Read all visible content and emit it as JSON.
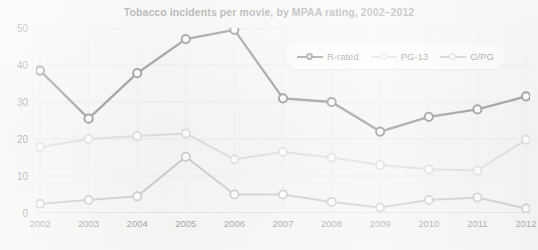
{
  "chart_data": {
    "type": "line",
    "title": "Tobacco incidents per movie, by MPAA rating, 2002–2012",
    "xlabel": "",
    "ylabel": "",
    "categories": [
      "2002",
      "2003",
      "2004",
      "2005",
      "2006",
      "2007",
      "2008",
      "2009",
      "2010",
      "2011",
      "2012"
    ],
    "ylim": [
      0,
      50
    ],
    "y_ticks": [
      0,
      10,
      20,
      30,
      40,
      50
    ],
    "grid": true,
    "legend_position": "top-right",
    "series": [
      {
        "name": "R-rated",
        "color": "#4a4a4a",
        "values": [
          38.5,
          25.5,
          37.8,
          47.0,
          49.5,
          31.0,
          30.0,
          22.0,
          26.0,
          28.0,
          31.5
        ]
      },
      {
        "name": "PG-13",
        "color": "#c9c9c7",
        "values": [
          17.8,
          20.0,
          20.8,
          21.5,
          14.5,
          16.5,
          15.0,
          13.0,
          11.8,
          11.5,
          19.8
        ]
      },
      {
        "name": "G/PG",
        "color": "#a9a9a7",
        "values": [
          2.5,
          3.5,
          4.5,
          15.2,
          5.0,
          5.0,
          3.0,
          1.5,
          3.5,
          4.2,
          1.2
        ]
      }
    ]
  },
  "legend": {
    "items": [
      {
        "label": "R-rated"
      },
      {
        "label": "PG-13"
      },
      {
        "label": "G/PG"
      }
    ]
  }
}
